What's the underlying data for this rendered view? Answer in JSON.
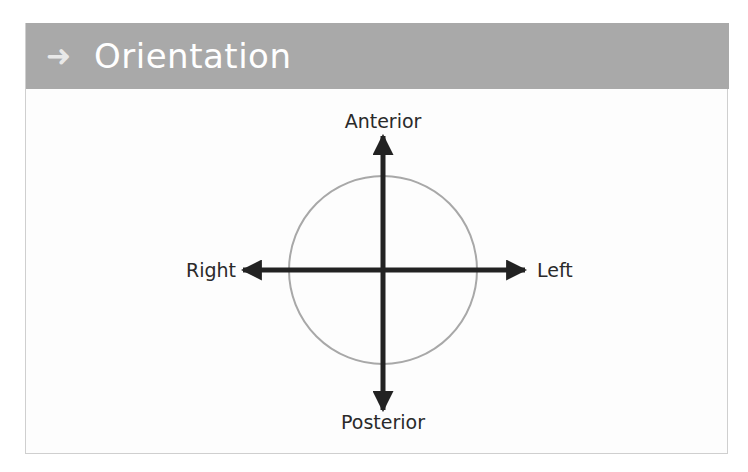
{
  "header": {
    "icon": "arrow-right-icon",
    "icon_glyph": "➜",
    "title": "Orientation",
    "background": "#a9a9a9"
  },
  "diagram": {
    "center": {
      "x": 383,
      "y": 270
    },
    "circle_radius": 94,
    "circle_color": "#a8a8a8",
    "arrow_color": "#222222",
    "labels": {
      "top": "Anterior",
      "bottom": "Posterior",
      "left": "Right",
      "right": "Left"
    }
  }
}
